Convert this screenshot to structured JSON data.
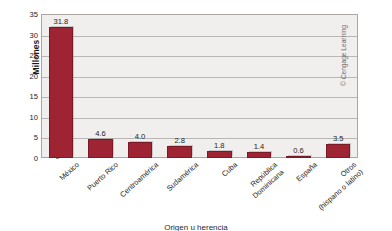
{
  "chart_data": {
    "type": "bar",
    "title": "",
    "xlabel": "Origen u herencia",
    "ylabel": "Millones",
    "ylim": [
      0,
      35
    ],
    "yticks": [
      0,
      5,
      10,
      15,
      20,
      25,
      30,
      35
    ],
    "grid": true,
    "legend": null,
    "categories": [
      "México",
      "Puerto Rico",
      "Centroamérica",
      "Sudamérica",
      "Cuba",
      "República Dominicana",
      "España",
      "Otros (hispano o latino)"
    ],
    "category_lines": [
      [
        "México",
        ""
      ],
      [
        "Puerto Rico",
        ""
      ],
      [
        "Centroamérica",
        ""
      ],
      [
        "Sudamérica",
        ""
      ],
      [
        "Cuba",
        ""
      ],
      [
        "República",
        "Dominicana"
      ],
      [
        "España",
        ""
      ],
      [
        "Otros",
        "(hispano o latino)"
      ]
    ],
    "values": [
      31.8,
      4.6,
      4.0,
      2.8,
      1.8,
      1.4,
      0.6,
      3.5
    ],
    "value_labels": [
      "31.8",
      "4.6",
      "4.0",
      "2.8",
      "1.8",
      "1.4",
      "0.6",
      "3.5"
    ],
    "bar_color": "#9e2434",
    "plot_background": "#f1efee",
    "gridline_color": "#b9b6b3"
  },
  "credit": {
    "text": "© Cengage Learning"
  }
}
